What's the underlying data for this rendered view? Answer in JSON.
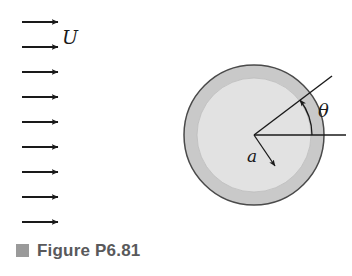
{
  "figure": {
    "caption": "Figure P6.81",
    "bullet_color": "#9a9a9a",
    "caption_color": "#59595b",
    "background": "#ffffff"
  },
  "labels": {
    "freestream_velocity": "U",
    "radius": "a",
    "angle": "θ"
  },
  "diagram_data": {
    "type": "schematic",
    "subject": "Uniform flow past a circular cylinder",
    "freestream": {
      "symbol": "U",
      "direction": "left-to-right",
      "arrow_count": 9,
      "arrow_color": "#1a1a1a",
      "arrow_x_start": 22,
      "arrow_x_end": 62,
      "arrow_y_values": [
        22,
        47,
        72,
        97,
        122,
        147,
        172,
        197,
        222
      ]
    },
    "cylinder": {
      "center_x": 254,
      "center_y": 135,
      "outer_radius": 70,
      "inner_radius": 57,
      "outer_ring_color": "#c9c9c9",
      "inner_fill_color": "#e2e2e2",
      "outline_color": "#4a4a4a",
      "radius_symbol": "a"
    },
    "angle": {
      "symbol": "θ",
      "value_degrees": 37,
      "measured_from": "positive x-axis (downstream horizontal)",
      "arc_radius": 58,
      "ray_length": 98
    },
    "reference_line": {
      "description": "horizontal reference axis through cylinder center",
      "x_start": 254,
      "x_end": 346,
      "y": 135
    }
  }
}
